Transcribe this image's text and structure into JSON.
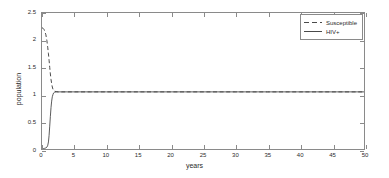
{
  "chart_data": {
    "type": "line",
    "title": "",
    "xlabel": "years",
    "ylabel": "population",
    "xlim": [
      0,
      50
    ],
    "ylim": [
      0,
      2.5
    ],
    "xticks": [
      0,
      5,
      10,
      15,
      20,
      25,
      30,
      35,
      40,
      45,
      50
    ],
    "yticks": [
      0,
      0.5,
      1,
      1.5,
      2,
      2.5
    ],
    "xtick_labels": [
      "0",
      "5",
      "10",
      "15",
      "20",
      "25",
      "30",
      "35",
      "40",
      "45",
      "50"
    ],
    "ytick_labels": [
      "0",
      "0.5",
      "1",
      "1.5",
      "2",
      "2.5"
    ],
    "grid": false,
    "legend_position": "upper right",
    "series": [
      {
        "name": "Susceptible",
        "style": "dashed",
        "color": "#4a4a4a",
        "x": [
          0,
          0.15,
          0.3,
          0.45,
          0.6,
          0.75,
          0.9,
          1.0,
          1.1,
          1.2,
          1.3,
          1.4,
          1.5,
          1.6,
          1.7,
          1.8,
          1.9,
          2.0,
          2.2,
          2.5,
          3.0,
          4.0,
          5.0,
          7.5,
          10,
          15,
          20,
          25,
          30,
          35,
          40,
          45,
          50
        ],
        "values": [
          2.23,
          2.22,
          2.2,
          2.16,
          2.1,
          2.0,
          1.86,
          1.75,
          1.63,
          1.5,
          1.38,
          1.28,
          1.2,
          1.14,
          1.1,
          1.08,
          1.07,
          1.06,
          1.055,
          1.05,
          1.05,
          1.05,
          1.05,
          1.05,
          1.05,
          1.05,
          1.05,
          1.05,
          1.05,
          1.05,
          1.05,
          1.05,
          1.05
        ]
      },
      {
        "name": "HIV+",
        "style": "solid",
        "color": "#4a4a4a",
        "x": [
          0,
          0.2,
          0.4,
          0.6,
          0.8,
          0.9,
          1.0,
          1.1,
          1.2,
          1.3,
          1.4,
          1.5,
          1.6,
          1.7,
          1.8,
          1.9,
          2.0,
          2.2,
          2.5,
          3.0,
          4.0,
          5.0,
          7.5,
          10,
          15,
          20,
          25,
          30,
          35,
          40,
          45,
          50
        ],
        "values": [
          0.005,
          0.008,
          0.012,
          0.02,
          0.04,
          0.07,
          0.13,
          0.25,
          0.42,
          0.6,
          0.76,
          0.88,
          0.96,
          1.0,
          1.03,
          1.04,
          1.045,
          1.05,
          1.05,
          1.05,
          1.05,
          1.05,
          1.05,
          1.05,
          1.05,
          1.05,
          1.05,
          1.05,
          1.05,
          1.05,
          1.05,
          1.05
        ]
      }
    ]
  },
  "legend": {
    "entries": [
      {
        "label": "Susceptible",
        "style": "dashed"
      },
      {
        "label": "HIV+",
        "style": "solid"
      }
    ]
  },
  "colors": {
    "axis": "#8a8a8a",
    "line": "#4a4a4a",
    "background": "#ffffff",
    "text": "#2b2b2b"
  }
}
